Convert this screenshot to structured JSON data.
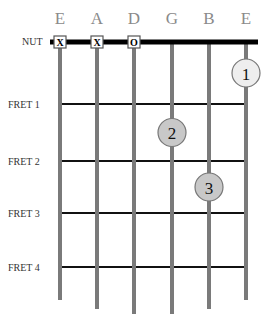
{
  "strings": [
    {
      "name": "E",
      "marker": "X"
    },
    {
      "name": "A",
      "marker": "X"
    },
    {
      "name": "D",
      "marker": "O"
    },
    {
      "name": "G",
      "marker": ""
    },
    {
      "name": "B",
      "marker": ""
    },
    {
      "name": "E",
      "marker": ""
    }
  ],
  "nut_label": "NUT",
  "frets": [
    {
      "label": "FRET 1"
    },
    {
      "label": "FRET 2"
    },
    {
      "label": "FRET 3"
    },
    {
      "label": "FRET 4"
    }
  ],
  "fingers": [
    {
      "number": "1",
      "string_index": 5,
      "fret_position": 0.5,
      "fill": "#eeeeee"
    },
    {
      "number": "2",
      "string_index": 3,
      "fret_position": 1.5,
      "fill": "#c8c8c8"
    },
    {
      "number": "3",
      "string_index": 4,
      "fret_position": 2.5,
      "fill": "#c8c8c8"
    }
  ],
  "colors": {
    "string": "#7a7a7a",
    "fret": "#111111",
    "nut": "#000000",
    "name": "#8a8a8a"
  }
}
